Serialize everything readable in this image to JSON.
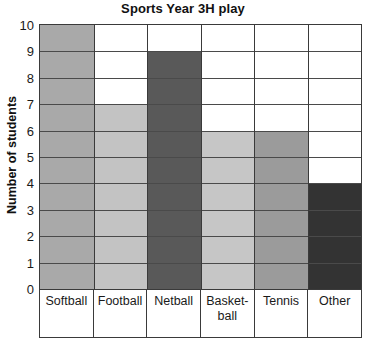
{
  "chart_data": {
    "type": "bar",
    "title": "Sports Year 3H play",
    "xlabel": "",
    "ylabel": "Number of students",
    "categories": [
      "Softball",
      "Football",
      "Netball",
      "Basket-ball",
      "Tennis",
      "Other"
    ],
    "category_lines": [
      [
        "Softball"
      ],
      [
        "Football"
      ],
      [
        "Netball"
      ],
      [
        "Basket-",
        "ball"
      ],
      [
        "Tennis"
      ],
      [
        "Other"
      ]
    ],
    "values": [
      10,
      7,
      9,
      6,
      6,
      4
    ],
    "bar_colors": [
      "#a9a9a9",
      "#c3c3c3",
      "#595959",
      "#c6c6c6",
      "#9b9b9b",
      "#333333"
    ],
    "ylim": [
      0,
      10
    ],
    "ytick_labels": [
      "10",
      "9",
      "8",
      "7",
      "6",
      "5",
      "4",
      "3",
      "2",
      "1",
      "0"
    ],
    "ytick_values": [
      10,
      9,
      8,
      7,
      6,
      5,
      4,
      3,
      2,
      1,
      0
    ],
    "grid": true,
    "legend": "none",
    "axis_color": "#3a3a3a",
    "grid_color": "#4a4a4a",
    "background": "#ffffff"
  }
}
